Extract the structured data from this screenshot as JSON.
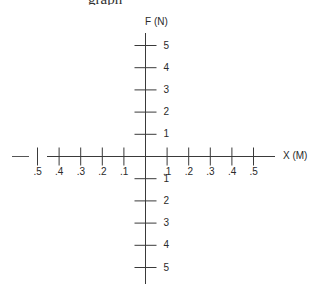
{
  "header": {
    "cropped_text": "graph"
  },
  "chart_data": {
    "type": "diagram",
    "title": "",
    "xlabel": "X (M)",
    "ylabel": "F (N)",
    "grid": false,
    "x_ticks": [
      -0.5,
      -0.4,
      -0.3,
      -0.2,
      -0.1,
      0.1,
      0.2,
      0.3,
      0.4,
      0.5
    ],
    "x_tick_labels": [
      ".5",
      ".4",
      ".3",
      ".2",
      ".1",
      ".1",
      ".2",
      ".3",
      ".4",
      ".5"
    ],
    "y_ticks": [
      5,
      4,
      3,
      2,
      1,
      -1,
      -2,
      -3,
      -4,
      -5
    ],
    "y_tick_labels": [
      "5",
      "4",
      "3",
      "2",
      "1",
      "1",
      "2",
      "3",
      "4",
      "5"
    ],
    "xlim": [
      -0.5,
      0.5
    ],
    "ylim": [
      -5,
      5
    ]
  },
  "colors": {
    "axis": "#3a3a3a",
    "text": "#2a2a2a"
  }
}
